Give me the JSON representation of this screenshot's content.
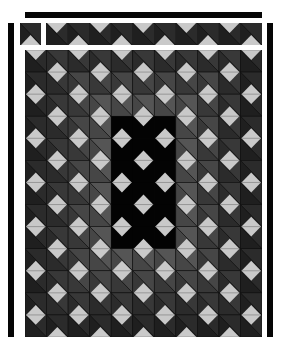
{
  "quilt": {
    "title": "Quilt pattern: diamonds on graduated grey half-square triangles",
    "colors": {
      "background": "#ffffff",
      "border_bar": "#050505",
      "diamond": "#c9c9c9",
      "seam": "#111111",
      "center_block": "#030303",
      "shades": [
        "#1f1f1f",
        "#2b2b2b",
        "#383838",
        "#464646",
        "#555555",
        "#626262"
      ]
    },
    "grid": {
      "cols": 11,
      "rows": 13,
      "x": 25,
      "y": 50,
      "width": 237,
      "height": 287
    },
    "center_block": {
      "col_start": 4,
      "col_end": 6,
      "row_start": 3,
      "row_end": 8
    },
    "top_strip": {
      "x": 46,
      "y": 23,
      "width": 216,
      "height": 22,
      "cells": 10
    },
    "corner_square": {
      "x": 20,
      "y": 23,
      "width": 21,
      "height": 22
    },
    "bars": [
      {
        "name": "top-bar",
        "x": 25,
        "y": 12,
        "width": 237,
        "height": 6
      },
      {
        "name": "left-bar",
        "x": 8,
        "y": 23,
        "width": 6,
        "height": 314
      },
      {
        "name": "right-bar",
        "x": 267,
        "y": 23,
        "width": 6,
        "height": 314
      }
    ]
  }
}
